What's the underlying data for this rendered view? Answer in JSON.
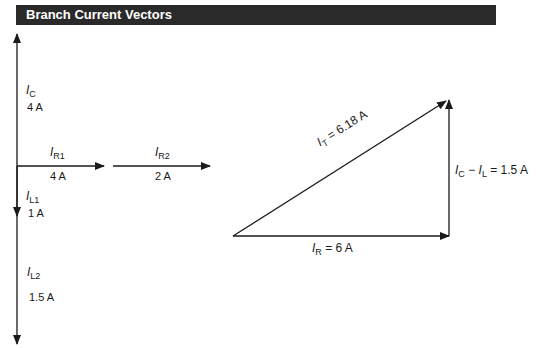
{
  "title": "Branch Current Vectors",
  "colors": {
    "title_bar": "#2a2a2a",
    "title_text": "#ffffff",
    "line": "#1a1a1a"
  },
  "left_diagram": {
    "ic": {
      "symbol": "I",
      "sub": "C",
      "value": "4 A"
    },
    "ir1": {
      "symbol": "I",
      "sub": "R1",
      "value": "4 A"
    },
    "ir2": {
      "symbol": "I",
      "sub": "R2",
      "value": "2 A"
    },
    "il1": {
      "symbol": "I",
      "sub": "L1",
      "value": "1 A"
    },
    "il2": {
      "symbol": "I",
      "sub": "L2",
      "value": "1.5 A"
    }
  },
  "triangle": {
    "it": {
      "symbol": "I",
      "sub": "T",
      "rest": " = 6.18 A"
    },
    "ir": {
      "symbol": "I",
      "sub": "R",
      "rest": " = 6 A"
    },
    "icl": {
      "symbol1": "I",
      "sub1": "C",
      "mid": " − ",
      "symbol2": "I",
      "sub2": "L",
      "rest": " = 1.5 A"
    }
  }
}
